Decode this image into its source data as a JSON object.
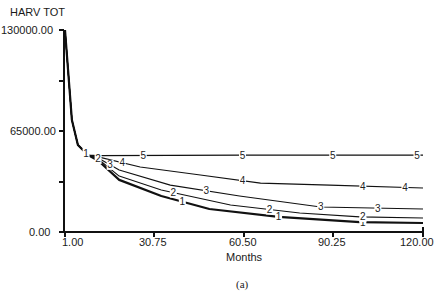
{
  "chart_data": {
    "type": "line",
    "title": "HARV TOT",
    "xlabel": "Months",
    "ylabel": "HARV TOT",
    "caption": "(a)",
    "xlim": [
      1,
      120
    ],
    "ylim": [
      0,
      130000
    ],
    "x_ticks": [
      "1.00",
      "30.75",
      "60.50",
      "90.25",
      "120.00"
    ],
    "y_ticks": [
      "0.00",
      "65000.00",
      "130000.00"
    ],
    "grid": false,
    "legend": "inline numeric markers 1-5 on curves",
    "series": [
      {
        "name": "1",
        "x": [
          1,
          3.3,
          5.3,
          8.6,
          12,
          19,
          33,
          49,
          72,
          99,
          120
        ],
        "values": [
          130000,
          72000,
          56000,
          49500,
          46000,
          33500,
          23200,
          14800,
          9700,
          6400,
          5800
        ]
      },
      {
        "name": "2",
        "x": [
          1,
          3.3,
          5.3,
          8.6,
          12,
          19,
          33,
          56,
          79,
          99,
          120
        ],
        "values": [
          130000,
          72000,
          56000,
          49500,
          47000,
          36000,
          27000,
          17400,
          12200,
          9700,
          9000
        ]
      },
      {
        "name": "3",
        "x": [
          1,
          3.3,
          5.3,
          8.6,
          12,
          19,
          36,
          59,
          86,
          120
        ],
        "values": [
          130000,
          72000,
          56000,
          49500,
          47600,
          39900,
          30200,
          23200,
          16100,
          14800
        ]
      },
      {
        "name": "4",
        "x": [
          1,
          3.3,
          5.3,
          8.6,
          12,
          26,
          46,
          66,
          89,
          120
        ],
        "values": [
          130000,
          72000,
          56000,
          49500,
          48300,
          41800,
          36700,
          31500,
          30200,
          28300
        ]
      },
      {
        "name": "5",
        "x": [
          1,
          3.3,
          5.3,
          8.6,
          12,
          60,
          120
        ],
        "values": [
          130000,
          72000,
          56000,
          49500,
          49200,
          49500,
          49500
        ]
      }
    ]
  }
}
